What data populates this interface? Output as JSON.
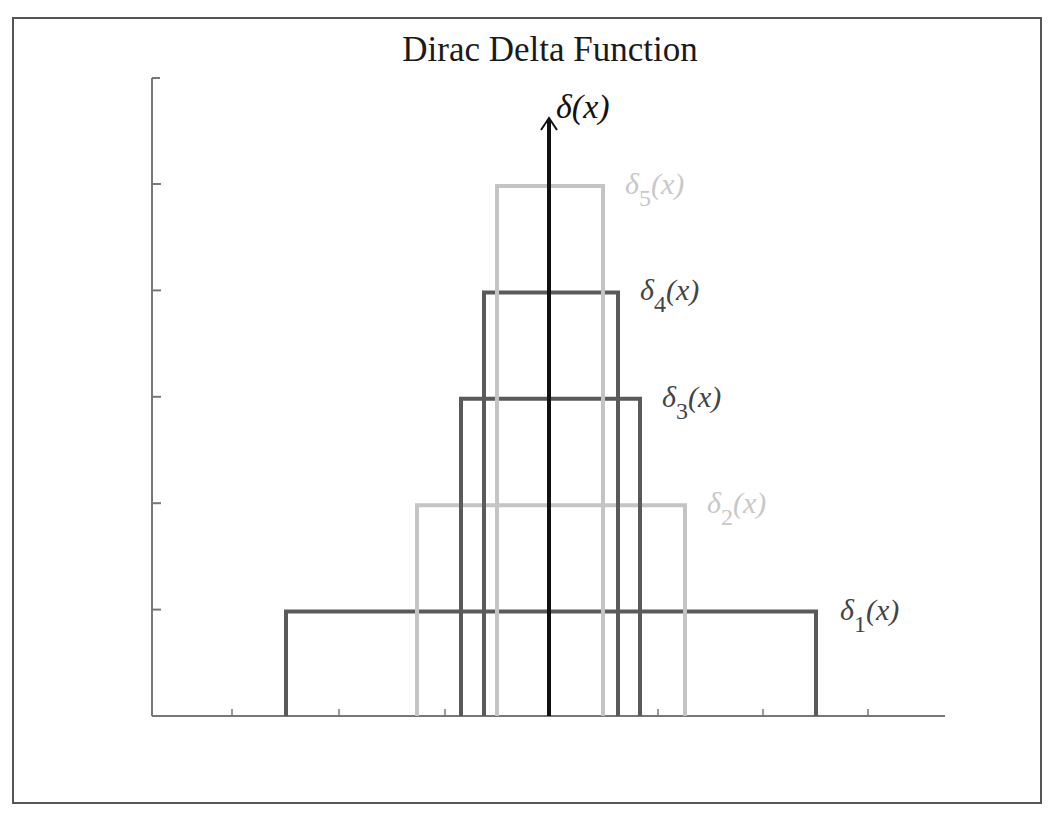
{
  "title": "Dirac Delta Function",
  "axis_label": "δ(x)",
  "colors": {
    "frame": "#555555",
    "axis": "#666666",
    "arrow": "#111111",
    "dark": "#5a5a5a",
    "light": "#c4c4c4",
    "light_label": "#c8c8c8",
    "dark_label": "#444444"
  },
  "chart_data": {
    "type": "line",
    "title": "Dirac Delta Function",
    "xlabel": "",
    "ylabel": "δ(x)",
    "grid": false,
    "x_ticks_count": 7,
    "y_ticks_count": 5,
    "series": [
      {
        "name": "δ1(x)",
        "sub": "1",
        "x_left": -2.5,
        "x_right": 2.5,
        "height": 1,
        "shade": "dark"
      },
      {
        "name": "δ2(x)",
        "sub": "2",
        "x_left": -1.25,
        "x_right": 1.25,
        "height": 2,
        "shade": "light"
      },
      {
        "name": "δ3(x)",
        "sub": "3",
        "x_left": -0.83,
        "x_right": 0.83,
        "height": 3,
        "shade": "dark"
      },
      {
        "name": "δ4(x)",
        "sub": "4",
        "x_left": -0.63,
        "x_right": 0.63,
        "height": 4,
        "shade": "dark"
      },
      {
        "name": "δ5(x)",
        "sub": "5",
        "x_left": -0.5,
        "x_right": 0.5,
        "height": 5,
        "shade": "light"
      }
    ]
  }
}
